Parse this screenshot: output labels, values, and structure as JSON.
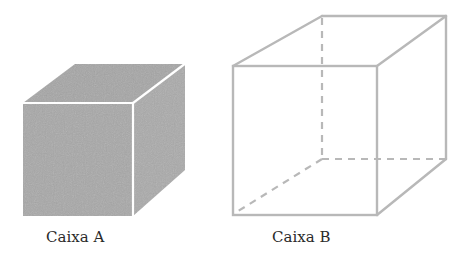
{
  "figure": {
    "type": "geometry-illustration",
    "colors": {
      "solid_fill": "#a9a9a9",
      "solid_edge": "#ffffff",
      "wire_edge": "#b8b8b8",
      "label_text": "#2a2a2a"
    }
  },
  "boxes": [
    {
      "id": "A",
      "label": "Caixa A",
      "style": "solid shaded cube",
      "front": {
        "x1": 23,
        "y1": 103,
        "x2": 133,
        "y2": 216
      },
      "back_offset": {
        "dx": 52,
        "dy": -39
      }
    },
    {
      "id": "B",
      "label": "Caixa B",
      "style": "wireframe cube with dashed hidden edges",
      "front": {
        "x1": 233,
        "y1": 66,
        "x2": 377,
        "y2": 215
      },
      "back": {
        "x1": 322,
        "y1": 16,
        "x2": 446,
        "y2": 159
      }
    }
  ]
}
